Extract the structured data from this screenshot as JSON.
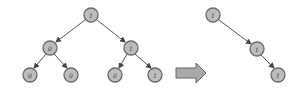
{
  "diagram": {
    "title": "",
    "left_tree": {
      "nodes": [
        {
          "id": "root",
          "label": "1",
          "x": 91,
          "y": 15
        },
        {
          "id": "l",
          "label": "0",
          "x": 50,
          "y": 48
        },
        {
          "id": "r",
          "label": "1",
          "x": 131,
          "y": 48
        },
        {
          "id": "ll",
          "label": "0",
          "x": 30,
          "y": 75
        },
        {
          "id": "lr",
          "label": "0",
          "x": 71,
          "y": 75
        },
        {
          "id": "rl",
          "label": "0",
          "x": 115,
          "y": 75
        },
        {
          "id": "rr",
          "label": "1",
          "x": 155,
          "y": 75
        }
      ],
      "edges": [
        [
          "root",
          "l"
        ],
        [
          "root",
          "r"
        ],
        [
          "l",
          "ll"
        ],
        [
          "l",
          "lr"
        ],
        [
          "r",
          "rl"
        ],
        [
          "r",
          "rr"
        ]
      ]
    },
    "transform_arrow": {
      "direction": "right",
      "color": "#a9a9a9"
    },
    "right_tree": {
      "nodes": [
        {
          "id": "a",
          "label": "1",
          "x": 213,
          "y": 15
        },
        {
          "id": "b",
          "label": "1",
          "x": 257,
          "y": 49
        },
        {
          "id": "c",
          "label": "1",
          "x": 278,
          "y": 75
        }
      ],
      "edges": [
        [
          "a",
          "b"
        ],
        [
          "b",
          "c"
        ]
      ]
    },
    "colors": {
      "node_fill": "#bdbdbd",
      "node_stroke": "#6a6a6a",
      "edge": "#555555"
    }
  }
}
